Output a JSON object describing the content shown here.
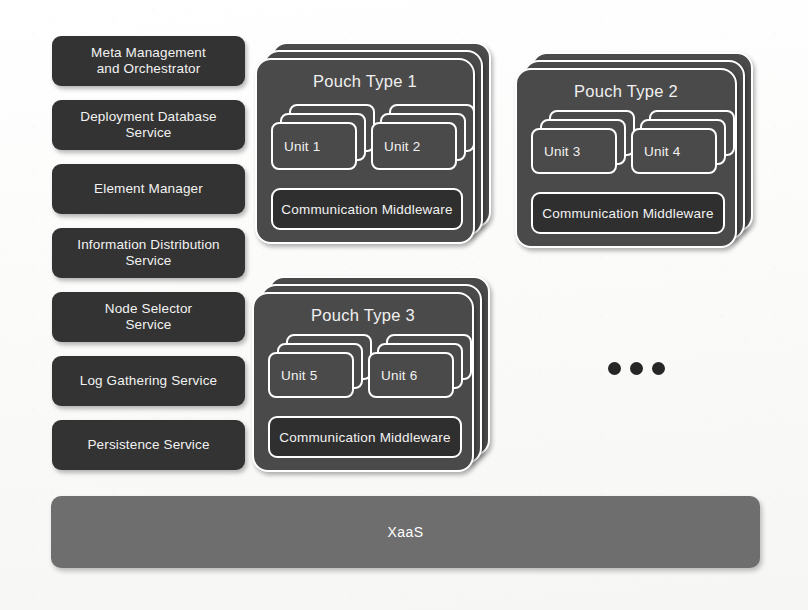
{
  "diagram": {
    "background_color": "#fdfdfc",
    "colors": {
      "service_box": "#333333",
      "pouch_fill": "#4a4a4a",
      "middleware_fill": "#2f2f2f",
      "xaas_fill": "#6e6e6e",
      "border": "#ffffff",
      "text": "#f2f2f2",
      "dot": "#262626"
    }
  },
  "services": [
    {
      "id": "meta-management-and-orchestrator",
      "label": "Meta Management\nand Orchestrator"
    },
    {
      "id": "deployment-database-service",
      "label": "Deployment Database\nService"
    },
    {
      "id": "element-manager",
      "label": "Element Manager"
    },
    {
      "id": "information-distribution-service",
      "label": "Information Distribution\nService"
    },
    {
      "id": "node-selector-service",
      "label": "Node Selector\nService"
    },
    {
      "id": "log-gathering-service",
      "label": "Log Gathering Service"
    },
    {
      "id": "persistence-service",
      "label": "Persistence Service"
    }
  ],
  "pouches": [
    {
      "id": "pouch-type-1",
      "title": "Pouch Type 1",
      "stack_count": 3,
      "units": [
        {
          "id": "unit-1",
          "label": "Unit 1",
          "stack_count": 3
        },
        {
          "id": "unit-2",
          "label": "Unit 2",
          "stack_count": 3
        }
      ],
      "middleware": {
        "id": "communication-middleware-1",
        "label": "Communication Middleware"
      }
    },
    {
      "id": "pouch-type-2",
      "title": "Pouch Type 2",
      "stack_count": 3,
      "units": [
        {
          "id": "unit-3",
          "label": "Unit 3",
          "stack_count": 3
        },
        {
          "id": "unit-4",
          "label": "Unit 4",
          "stack_count": 3
        }
      ],
      "middleware": {
        "id": "communication-middleware-2",
        "label": "Communication Middleware"
      }
    },
    {
      "id": "pouch-type-3",
      "title": "Pouch Type 3",
      "stack_count": 3,
      "units": [
        {
          "id": "unit-5",
          "label": "Unit 5",
          "stack_count": 3
        },
        {
          "id": "unit-6",
          "label": "Unit 6",
          "stack_count": 3
        }
      ],
      "middleware": {
        "id": "communication-middleware-3",
        "label": "Communication Middleware"
      }
    }
  ],
  "ellipsis": {
    "id": "more-pouches-ellipsis",
    "label": "•••",
    "dot_count": 3
  },
  "base_layer": {
    "id": "xaas",
    "label": "XaaS"
  }
}
